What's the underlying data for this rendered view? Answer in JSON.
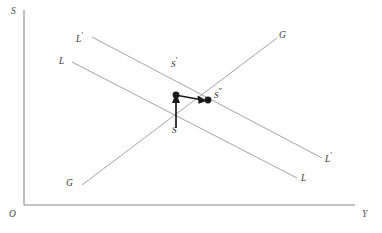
{
  "figure": {
    "background_color": "#ffffff",
    "axis_color": "#8a8a8a",
    "curve_color": "#9a9a9a",
    "arrow_color": "#1a1a1a",
    "width": 382,
    "height": 233
  },
  "axes": {
    "vertical_label": "S",
    "horizontal_label": "Y",
    "origin_label": "O",
    "vertical_axis": {
      "x": 24,
      "y_top": 10,
      "y_bottom": 205
    },
    "horizontal_axis": {
      "y": 205,
      "x_left": 24,
      "x_right": 355
    }
  },
  "curves": [
    {
      "id": "LL",
      "label_left": "L",
      "label_right": "L",
      "slope": "downward",
      "x1": 72,
      "y1": 62,
      "x2": 297,
      "y2": 178
    },
    {
      "id": "L-prime-L-prime",
      "label_left": "L",
      "label_left_prime": "′",
      "label_right": "L",
      "label_right_prime": "′",
      "slope": "downward",
      "x1": 92,
      "y1": 37,
      "x2": 322,
      "y2": 158
    },
    {
      "id": "GG",
      "label_left": "G",
      "label_right": "G",
      "slope": "upward",
      "x1": 82,
      "y1": 185,
      "x2": 277,
      "y2": 38
    }
  ],
  "points": [
    {
      "id": "S",
      "label": "S",
      "prime": "",
      "x": 176,
      "y": 128,
      "dot": false
    },
    {
      "id": "S-prime",
      "label": "S",
      "prime": "′",
      "x": 176,
      "y": 96,
      "dot": true
    },
    {
      "id": "S-dprime",
      "label": "S",
      "prime": "″",
      "x": 208,
      "y": 100,
      "dot": true
    }
  ],
  "arrows": [
    {
      "id": "arrow-S-to-S-prime",
      "from_x": 176,
      "from_y": 128,
      "to_x": 176,
      "to_y": 96,
      "direction": "up"
    },
    {
      "id": "arrow-S-prime-to-S-dprime",
      "from_x": 179,
      "from_y": 96,
      "to_x": 206,
      "to_y": 100,
      "direction": "right-down"
    }
  ],
  "labels": {
    "axis_s": {
      "text": "S",
      "x": 11,
      "y": 9
    },
    "axis_y": {
      "text": "Y",
      "x": 362,
      "y": 211
    },
    "origin_o": {
      "text": "O",
      "x": 9,
      "y": 211
    },
    "ll_left": {
      "text": "L",
      "prime": "",
      "x": 59,
      "y": 58
    },
    "ll_right": {
      "text": "L",
      "prime": "",
      "x": 301,
      "y": 175
    },
    "llp_left": {
      "text": "L",
      "prime": "′",
      "x": 76,
      "y": 33
    },
    "llp_right": {
      "text": "L",
      "prime": "′",
      "x": 325,
      "y": 153
    },
    "gg_left": {
      "text": "G",
      "prime": "",
      "x": 66,
      "y": 180
    },
    "gg_right": {
      "text": "G",
      "prime": "",
      "x": 279,
      "y": 32
    },
    "pt_s": {
      "text": "S",
      "prime": "",
      "x": 172,
      "y": 127
    },
    "pt_sp": {
      "text": "S",
      "prime": "′",
      "x": 171,
      "y": 58
    },
    "pt_sdp": {
      "text": "S",
      "prime": "″",
      "x": 214,
      "y": 89
    }
  }
}
